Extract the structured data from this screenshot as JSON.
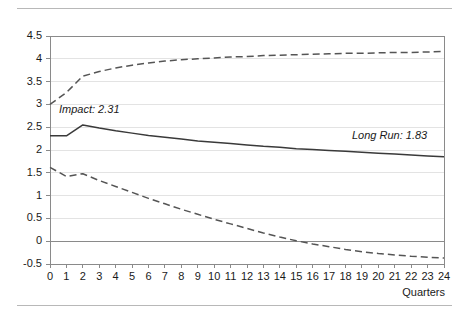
{
  "chart_data": {
    "type": "line",
    "title": "",
    "subtitle": "",
    "xlabel": "Quarters",
    "ylabel": "",
    "xlim": [
      0,
      24
    ],
    "ylim": [
      -0.5,
      4.5
    ],
    "grid": true,
    "legend": "none",
    "x": [
      0,
      1,
      2,
      3,
      4,
      5,
      6,
      7,
      8,
      9,
      10,
      11,
      12,
      13,
      14,
      15,
      16,
      17,
      18,
      19,
      20,
      21,
      22,
      23,
      24
    ],
    "xticklabels": [
      "0",
      "1",
      "2",
      "3",
      "4",
      "5",
      "6",
      "7",
      "8",
      "9",
      "10",
      "11",
      "12",
      "13",
      "14",
      "15",
      "16",
      "17",
      "18",
      "19",
      "20",
      "21",
      "22",
      "23",
      "24"
    ],
    "yticklabels": [
      "4.5",
      "4",
      "3.5",
      "3",
      "2.5",
      "2",
      "1.5",
      "1",
      "0.5",
      "0",
      "-0.5"
    ],
    "yticks": [
      4.5,
      4,
      3.5,
      3,
      2.5,
      2,
      1.5,
      1,
      0.5,
      0,
      -0.5
    ],
    "series": [
      {
        "name": "upper-confidence-band",
        "style": "dashed",
        "color": "#555555",
        "values": [
          3.0,
          3.26,
          3.62,
          3.72,
          3.8,
          3.86,
          3.91,
          3.95,
          3.98,
          4.0,
          4.02,
          4.04,
          4.05,
          4.07,
          4.08,
          4.09,
          4.1,
          4.11,
          4.12,
          4.12,
          4.13,
          4.14,
          4.14,
          4.15,
          4.16
        ]
      },
      {
        "name": "point-estimate",
        "style": "solid",
        "color": "#3a3a3a",
        "values": [
          2.31,
          2.31,
          2.55,
          2.48,
          2.42,
          2.37,
          2.32,
          2.28,
          2.24,
          2.2,
          2.17,
          2.14,
          2.11,
          2.08,
          2.06,
          2.03,
          2.01,
          1.99,
          1.97,
          1.95,
          1.93,
          1.91,
          1.89,
          1.87,
          1.85
        ]
      },
      {
        "name": "lower-confidence-band",
        "style": "dashed",
        "color": "#555555",
        "values": [
          1.62,
          1.42,
          1.48,
          1.33,
          1.2,
          1.07,
          0.94,
          0.82,
          0.7,
          0.59,
          0.48,
          0.38,
          0.28,
          0.18,
          0.09,
          0.01,
          -0.06,
          -0.12,
          -0.18,
          -0.23,
          -0.27,
          -0.3,
          -0.33,
          -0.35,
          -0.37
        ]
      }
    ],
    "annotations": [
      {
        "name": "impact",
        "text": "Impact: 2.31",
        "value": 2.31
      },
      {
        "name": "long-run",
        "text": "Long Run:  1.83",
        "value": 1.83
      }
    ]
  },
  "axis": {
    "x_title": "Quarters"
  },
  "colors": {
    "gridline": "#e3e3e3",
    "axis": "#8a8a8a",
    "zero_line": "#8a8a8a",
    "solid_series": "#3a3a3a",
    "dashed_series": "#555555",
    "rule": "#b8b8b8",
    "text": "#1a1a1a"
  }
}
